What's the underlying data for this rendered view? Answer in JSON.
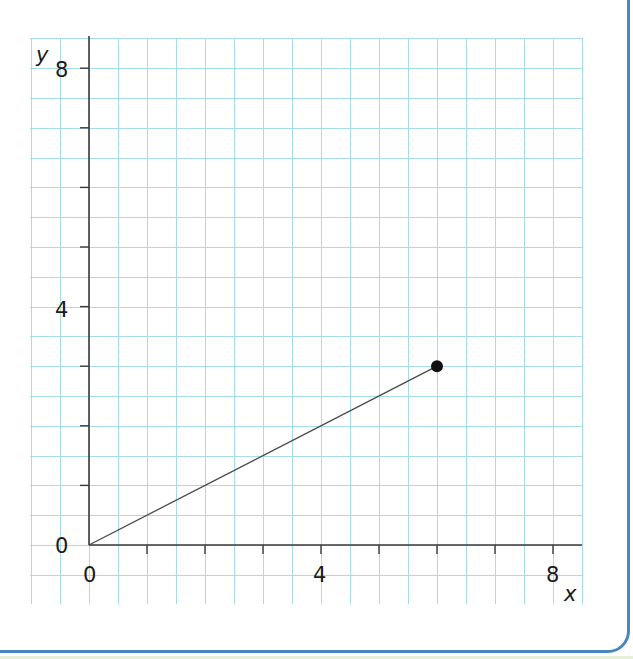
{
  "chart_data": {
    "type": "line",
    "title": "",
    "xlabel": "x",
    "ylabel": "y",
    "xlim": [
      -2,
      8.5
    ],
    "ylim": [
      -1,
      8.5
    ],
    "x_ticks": [
      0,
      1,
      2,
      3,
      4,
      5,
      6,
      7,
      8
    ],
    "y_ticks": [
      0,
      1,
      2,
      3,
      4,
      5,
      6,
      7,
      8
    ],
    "x_tick_labels": {
      "0": "0",
      "4": "4",
      "8": "8"
    },
    "y_tick_labels": {
      "0": "0",
      "4": "4",
      "8": "8"
    },
    "grid": true,
    "grid_step": 0.5,
    "series": [
      {
        "name": "segment",
        "points": [
          [
            0,
            0
          ],
          [
            6,
            3
          ]
        ],
        "endpoint_marker": [
          6,
          3
        ]
      }
    ],
    "legend": null
  },
  "colors": {
    "grid": "#a9daea",
    "axis": "#3a3a3a",
    "frame_border": "#4a86c0",
    "point": "#111111"
  },
  "labels": {
    "x_axis_name": "x",
    "y_axis_name": "y",
    "x_label_0": "0",
    "x_label_4": "4",
    "x_label_8": "8",
    "y_label_0": "0",
    "y_label_4": "4",
    "y_label_8": "8"
  }
}
